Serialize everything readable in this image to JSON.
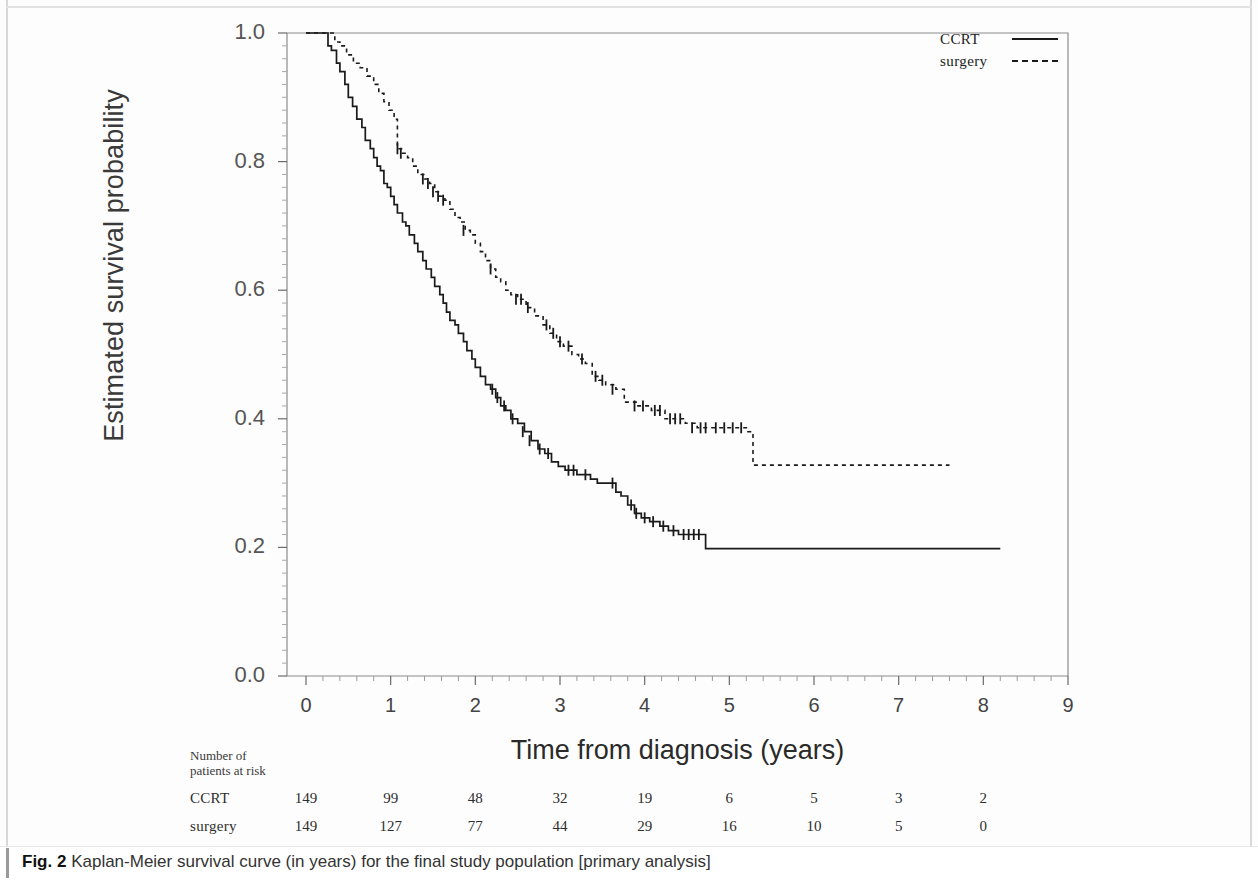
{
  "figure": {
    "caption_prefix": "Fig. 2",
    "caption_text": " Kaplan-Meier survival curve (in years) for the final study population [primary analysis]"
  },
  "legend": {
    "position": "top-right",
    "entries": [
      {
        "label": "CCRT",
        "style": "solid"
      },
      {
        "label": "surgery",
        "style": "dashed"
      }
    ]
  },
  "risk_table": {
    "header_line1": "Number of",
    "header_line2": "patients at risk",
    "rows": [
      {
        "name": "CCRT",
        "values": [
          "149",
          "99",
          "48",
          "32",
          "19",
          "6",
          "5",
          "3",
          "2"
        ]
      },
      {
        "name": "surgery",
        "values": [
          "149",
          "127",
          "77",
          "44",
          "29",
          "16",
          "10",
          "5",
          "0"
        ]
      }
    ]
  },
  "chart_data": {
    "type": "line",
    "subtype": "kaplan-meier-survival",
    "title": "",
    "xlabel": "Time from diagnosis (years)",
    "ylabel": "Estimated survival probability",
    "xlim": [
      0,
      9
    ],
    "ylim": [
      0.0,
      1.0
    ],
    "xticks": [
      0,
      1,
      2,
      3,
      4,
      5,
      6,
      7,
      8,
      9
    ],
    "xtick_labels": [
      "0",
      "1",
      "2",
      "3",
      "4",
      "5",
      "6",
      "7",
      "8",
      "9"
    ],
    "yticks": [
      0.0,
      0.2,
      0.4,
      0.6,
      0.8,
      1.0
    ],
    "ytick_labels": [
      "0.0",
      "0.2",
      "0.4",
      "0.6",
      "0.8",
      "1.0"
    ],
    "grid": false,
    "minor_ticks_x": true,
    "minor_ticks_y": true,
    "line_color": "#1a1a1a",
    "series": [
      {
        "name": "CCRT",
        "style": "solid",
        "final_value": 0.198,
        "max_time": 8.2,
        "steps": [
          [
            0.0,
            1.0
          ],
          [
            0.22,
            1.0
          ],
          [
            0.26,
            0.98
          ],
          [
            0.3,
            0.973
          ],
          [
            0.36,
            0.953
          ],
          [
            0.4,
            0.94
          ],
          [
            0.46,
            0.92
          ],
          [
            0.5,
            0.9
          ],
          [
            0.55,
            0.886
          ],
          [
            0.6,
            0.866
          ],
          [
            0.66,
            0.853
          ],
          [
            0.7,
            0.833
          ],
          [
            0.76,
            0.82
          ],
          [
            0.8,
            0.806
          ],
          [
            0.84,
            0.793
          ],
          [
            0.88,
            0.786
          ],
          [
            0.92,
            0.766
          ],
          [
            0.96,
            0.76
          ],
          [
            1.0,
            0.746
          ],
          [
            1.04,
            0.733
          ],
          [
            1.08,
            0.72
          ],
          [
            1.14,
            0.706
          ],
          [
            1.18,
            0.7
          ],
          [
            1.22,
            0.686
          ],
          [
            1.28,
            0.673
          ],
          [
            1.32,
            0.66
          ],
          [
            1.38,
            0.646
          ],
          [
            1.42,
            0.633
          ],
          [
            1.48,
            0.62
          ],
          [
            1.52,
            0.606
          ],
          [
            1.58,
            0.593
          ],
          [
            1.62,
            0.58
          ],
          [
            1.66,
            0.566
          ],
          [
            1.7,
            0.553
          ],
          [
            1.76,
            0.546
          ],
          [
            1.8,
            0.533
          ],
          [
            1.86,
            0.52
          ],
          [
            1.9,
            0.506
          ],
          [
            1.96,
            0.493
          ],
          [
            2.0,
            0.48
          ],
          [
            2.06,
            0.466
          ],
          [
            2.12,
            0.453
          ],
          [
            2.18,
            0.446
          ],
          [
            2.24,
            0.433
          ],
          [
            2.3,
            0.42
          ],
          [
            2.36,
            0.413
          ],
          [
            2.42,
            0.4
          ],
          [
            2.5,
            0.393
          ],
          [
            2.58,
            0.38
          ],
          [
            2.66,
            0.366
          ],
          [
            2.74,
            0.353
          ],
          [
            2.82,
            0.346
          ],
          [
            2.9,
            0.333
          ],
          [
            2.98,
            0.326
          ],
          [
            3.06,
            0.32
          ],
          [
            3.2,
            0.313
          ],
          [
            3.36,
            0.306
          ],
          [
            3.44,
            0.3
          ],
          [
            3.6,
            0.3
          ],
          [
            3.66,
            0.286
          ],
          [
            3.72,
            0.28
          ],
          [
            3.8,
            0.266
          ],
          [
            3.88,
            0.253
          ],
          [
            3.96,
            0.246
          ],
          [
            4.06,
            0.24
          ],
          [
            4.18,
            0.233
          ],
          [
            4.28,
            0.226
          ],
          [
            4.4,
            0.22
          ],
          [
            4.7,
            0.22
          ],
          [
            4.72,
            0.198
          ],
          [
            8.2,
            0.198
          ]
        ],
        "censor_marks": [
          [
            2.2,
            0.446
          ],
          [
            2.26,
            0.433
          ],
          [
            2.34,
            0.42
          ],
          [
            2.44,
            0.4
          ],
          [
            2.56,
            0.38
          ],
          [
            2.64,
            0.366
          ],
          [
            2.76,
            0.353
          ],
          [
            2.86,
            0.346
          ],
          [
            3.1,
            0.32
          ],
          [
            3.16,
            0.32
          ],
          [
            3.3,
            0.313
          ],
          [
            3.62,
            0.3
          ],
          [
            3.84,
            0.266
          ],
          [
            3.9,
            0.253
          ],
          [
            4.0,
            0.246
          ],
          [
            4.1,
            0.24
          ],
          [
            4.22,
            0.233
          ],
          [
            4.34,
            0.226
          ],
          [
            4.46,
            0.22
          ],
          [
            4.52,
            0.22
          ],
          [
            4.58,
            0.22
          ],
          [
            4.64,
            0.22
          ]
        ]
      },
      {
        "name": "surgery",
        "style": "dashed",
        "final_value": 0.328,
        "max_time": 7.6,
        "steps": [
          [
            0.0,
            1.0
          ],
          [
            0.3,
            1.0
          ],
          [
            0.34,
            0.986
          ],
          [
            0.4,
            0.98
          ],
          [
            0.48,
            0.966
          ],
          [
            0.56,
            0.953
          ],
          [
            0.64,
            0.946
          ],
          [
            0.72,
            0.933
          ],
          [
            0.8,
            0.92
          ],
          [
            0.86,
            0.906
          ],
          [
            0.92,
            0.893
          ],
          [
            0.98,
            0.88
          ],
          [
            1.04,
            0.866
          ],
          [
            1.08,
            0.82
          ],
          [
            1.14,
            0.813
          ],
          [
            1.2,
            0.806
          ],
          [
            1.26,
            0.793
          ],
          [
            1.32,
            0.78
          ],
          [
            1.4,
            0.773
          ],
          [
            1.46,
            0.766
          ],
          [
            1.52,
            0.753
          ],
          [
            1.58,
            0.746
          ],
          [
            1.64,
            0.74
          ],
          [
            1.7,
            0.726
          ],
          [
            1.76,
            0.713
          ],
          [
            1.82,
            0.706
          ],
          [
            1.88,
            0.693
          ],
          [
            1.94,
            0.686
          ],
          [
            2.0,
            0.673
          ],
          [
            2.06,
            0.66
          ],
          [
            2.12,
            0.646
          ],
          [
            2.18,
            0.633
          ],
          [
            2.24,
            0.62
          ],
          [
            2.3,
            0.613
          ],
          [
            2.36,
            0.6
          ],
          [
            2.42,
            0.593
          ],
          [
            2.5,
            0.586
          ],
          [
            2.6,
            0.573
          ],
          [
            2.7,
            0.56
          ],
          [
            2.8,
            0.546
          ],
          [
            2.88,
            0.533
          ],
          [
            2.96,
            0.52
          ],
          [
            3.04,
            0.513
          ],
          [
            3.14,
            0.5
          ],
          [
            3.22,
            0.493
          ],
          [
            3.3,
            0.486
          ],
          [
            3.38,
            0.466
          ],
          [
            3.46,
            0.46
          ],
          [
            3.54,
            0.453
          ],
          [
            3.66,
            0.446
          ],
          [
            3.76,
            0.426
          ],
          [
            3.92,
            0.42
          ],
          [
            4.08,
            0.413
          ],
          [
            4.24,
            0.4
          ],
          [
            4.4,
            0.4
          ],
          [
            4.48,
            0.393
          ],
          [
            4.62,
            0.386
          ],
          [
            4.76,
            0.386
          ],
          [
            5.0,
            0.386
          ],
          [
            5.22,
            0.38
          ],
          [
            5.28,
            0.328
          ],
          [
            7.6,
            0.328
          ]
        ],
        "censor_marks": [
          [
            1.08,
            0.82
          ],
          [
            1.12,
            0.813
          ],
          [
            1.38,
            0.773
          ],
          [
            1.44,
            0.766
          ],
          [
            1.5,
            0.753
          ],
          [
            1.56,
            0.746
          ],
          [
            1.62,
            0.74
          ],
          [
            1.86,
            0.693
          ],
          [
            2.18,
            0.633
          ],
          [
            2.48,
            0.586
          ],
          [
            2.54,
            0.586
          ],
          [
            2.62,
            0.573
          ],
          [
            2.84,
            0.546
          ],
          [
            2.92,
            0.533
          ],
          [
            3.0,
            0.52
          ],
          [
            3.1,
            0.513
          ],
          [
            3.26,
            0.493
          ],
          [
            3.42,
            0.466
          ],
          [
            3.5,
            0.46
          ],
          [
            3.62,
            0.446
          ],
          [
            3.88,
            0.42
          ],
          [
            3.98,
            0.42
          ],
          [
            4.12,
            0.413
          ],
          [
            4.18,
            0.413
          ],
          [
            4.3,
            0.4
          ],
          [
            4.36,
            0.4
          ],
          [
            4.42,
            0.4
          ],
          [
            4.56,
            0.386
          ],
          [
            4.66,
            0.386
          ],
          [
            4.72,
            0.386
          ],
          [
            4.84,
            0.386
          ],
          [
            4.94,
            0.386
          ],
          [
            5.04,
            0.386
          ],
          [
            5.14,
            0.386
          ]
        ]
      }
    ]
  }
}
